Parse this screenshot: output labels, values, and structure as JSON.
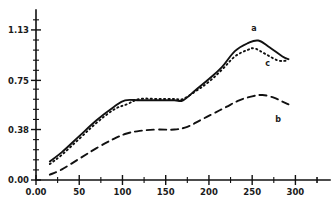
{
  "chart_data": {
    "type": "line",
    "title": "",
    "xlabel": "",
    "ylabel": "",
    "xlim": [
      0,
      340
    ],
    "ylim": [
      0,
      1.28
    ],
    "grid": false,
    "legend_position": "inline-end-of-series",
    "x_ticks": [
      "0.00",
      "50",
      "100",
      "150",
      "200",
      "250",
      "300"
    ],
    "x_tick_values": [
      0,
      50,
      100,
      150,
      200,
      250,
      300
    ],
    "y_ticks": [
      "0.00",
      "0.38",
      "0.75",
      "1.13"
    ],
    "y_tick_values": [
      0.0,
      0.38,
      0.75,
      1.13
    ],
    "x_minor_tick_count": 1,
    "y_minor_tick_count": 4,
    "series": [
      {
        "name": "a",
        "label": "a",
        "style": "solid",
        "color": "#111111",
        "x": [
          16,
          30,
          50,
          70,
          90,
          103,
          120,
          140,
          160,
          170,
          185,
          200,
          215,
          230,
          245,
          257,
          270,
          285,
          292
        ],
        "values": [
          0.14,
          0.21,
          0.33,
          0.45,
          0.55,
          0.6,
          0.6,
          0.6,
          0.6,
          0.6,
          0.68,
          0.76,
          0.85,
          0.97,
          1.03,
          1.05,
          1.0,
          0.93,
          0.91
        ]
      },
      {
        "name": "b",
        "label": "b",
        "style": "dashed",
        "color": "#111111",
        "x": [
          16,
          30,
          50,
          70,
          90,
          105,
          120,
          140,
          160,
          175,
          190,
          205,
          220,
          235,
          250,
          262,
          275,
          285,
          292
        ],
        "values": [
          0.04,
          0.08,
          0.16,
          0.24,
          0.31,
          0.35,
          0.37,
          0.38,
          0.38,
          0.4,
          0.45,
          0.5,
          0.55,
          0.6,
          0.63,
          0.64,
          0.62,
          0.59,
          0.57
        ]
      },
      {
        "name": "c",
        "label": "c",
        "style": "dotted",
        "color": "#111111",
        "x": [
          16,
          30,
          50,
          70,
          90,
          105,
          120,
          140,
          160,
          170,
          185,
          200,
          215,
          230,
          245,
          253,
          265,
          280,
          292
        ],
        "values": [
          0.12,
          0.19,
          0.31,
          0.43,
          0.53,
          0.57,
          0.61,
          0.61,
          0.61,
          0.61,
          0.67,
          0.74,
          0.83,
          0.93,
          0.98,
          0.99,
          0.95,
          0.9,
          0.9
        ]
      }
    ],
    "annotations": [
      {
        "text": "a",
        "x": 252,
        "y": 1.12,
        "series": "a"
      },
      {
        "text": "c",
        "x": 268,
        "y": 0.86,
        "series": "c"
      },
      {
        "text": "b",
        "x": 280,
        "y": 0.44,
        "series": "b"
      }
    ]
  }
}
